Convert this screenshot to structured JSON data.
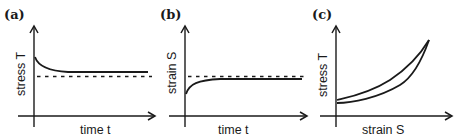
{
  "figure": {
    "panels": [
      {
        "id": "a",
        "label": "(a)",
        "ylabel": "stress T",
        "xlabel": "time t",
        "description": "Stress relaxation: stress decays from initial value to an asymptote above the dashed reference level"
      },
      {
        "id": "b",
        "label": "(b)",
        "ylabel": "strain S",
        "xlabel": "time t",
        "description": "Creep: strain rises from an initial value toward an asymptote just below the dashed reference level"
      },
      {
        "id": "c",
        "label": "(c)",
        "ylabel": "stress T",
        "xlabel": "strain S",
        "description": "Hysteresis: loading and unloading curves form a narrow loop rising nonlinearly"
      }
    ]
  },
  "colors": {
    "ink": "#1a1a1a",
    "background": "#ffffff"
  }
}
